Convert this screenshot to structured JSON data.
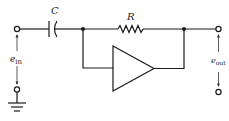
{
  "diagram": {
    "type": "circuit-schematic",
    "components": {
      "capacitor": {
        "label": "C"
      },
      "resistor": {
        "label": "R"
      },
      "opamp": {
        "label": ""
      }
    },
    "labels": {
      "input_voltage": "e",
      "input_voltage_sub": "in",
      "output_voltage": "e",
      "output_voltage_sub": "out",
      "capacitor": "C",
      "resistor": "R"
    },
    "colors": {
      "line": "#1a1a1a",
      "background": "#ffffff"
    }
  }
}
